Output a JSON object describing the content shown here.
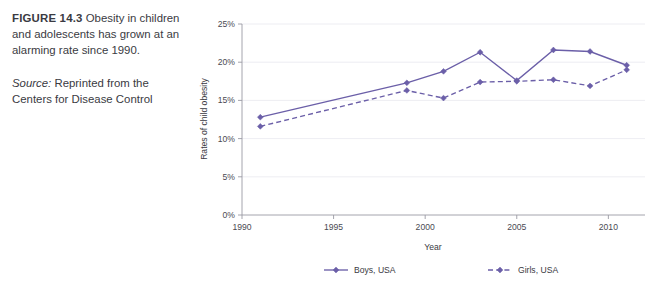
{
  "caption": {
    "figure_label": "FIGURE 14.3",
    "title_text": " Obesity in children and adolescents has grown at an alarming rate since 1990.",
    "source_label": "Source:",
    "source_text": " Reprinted from the Centers for Disease Control"
  },
  "chart_data": {
    "type": "line",
    "title": "",
    "xlabel": "Year",
    "ylabel": "Rates of child obesity",
    "xlim": [
      1990,
      2012
    ],
    "ylim": [
      0,
      25
    ],
    "xticks": [
      "1990",
      "1995",
      "2000",
      "2005",
      "2010"
    ],
    "xtick_values": [
      1990,
      1995,
      2000,
      2005,
      2010
    ],
    "yticks": [
      "0%",
      "5%",
      "10%",
      "15%",
      "20%",
      "25%"
    ],
    "ytick_values": [
      0,
      5,
      10,
      15,
      20,
      25
    ],
    "grid": true,
    "legend_position": "bottom",
    "x": [
      1991,
      1999,
      2001,
      2003,
      2005,
      2007,
      2009,
      2011
    ],
    "series": [
      {
        "name": "Boys, USA",
        "style": "solid",
        "marker": "diamond",
        "color": "#6B5FA8",
        "values": [
          12.8,
          17.3,
          18.8,
          21.3,
          17.6,
          21.6,
          21.4,
          19.6
        ]
      },
      {
        "name": "Girls, USA",
        "style": "dashed",
        "marker": "diamond",
        "color": "#6B5FA8",
        "values": [
          11.6,
          16.3,
          15.3,
          17.4,
          17.5,
          17.7,
          16.9,
          19.0
        ]
      }
    ]
  },
  "legend": {
    "items": [
      {
        "label": "Boys, USA"
      },
      {
        "label": "Girls, USA"
      }
    ]
  },
  "colors": {
    "series_line": "#6B5FA8",
    "gridline": "#e9e9ef",
    "axis": "#9a9aa4",
    "text": "#3a3a42"
  }
}
